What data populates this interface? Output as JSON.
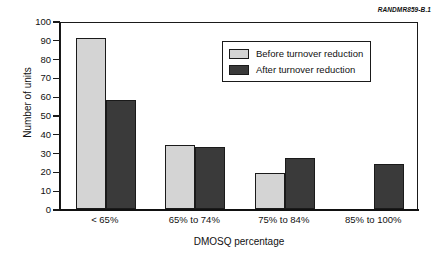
{
  "source_tag": "RANDMR859-B.1",
  "legend": {
    "position": "top-right-inside",
    "entries": [
      {
        "label": "Before turnover reduction",
        "color": "#d4d4d4",
        "swatch_name": "legend-swatch-before"
      },
      {
        "label": "After turnover reduction",
        "color": "#3a3a3a",
        "swatch_name": "legend-swatch-after"
      }
    ]
  },
  "chart_data": {
    "type": "bar",
    "title": "",
    "subtitle": "",
    "xlabel": "DMOSQ percentage",
    "ylabel": "Number of units",
    "categories": [
      "< 65%",
      "65% to 74%",
      "75% to 84%",
      "85% to 100%"
    ],
    "series": [
      {
        "name": "Before turnover reduction",
        "color": "#d4d4d4",
        "values": [
          91,
          34,
          19,
          0
        ]
      },
      {
        "name": "After turnover reduction",
        "color": "#3a3a3a",
        "values": [
          58,
          33,
          27,
          24
        ]
      }
    ],
    "ylim": [
      0,
      100
    ],
    "yticks": [
      0,
      10,
      20,
      30,
      40,
      50,
      60,
      70,
      80,
      90,
      100
    ],
    "ytick_labels": [
      "0",
      "10",
      "20",
      "30",
      "40",
      "50",
      "60",
      "70",
      "80",
      "90",
      "100"
    ],
    "grid": false,
    "legend_position": "upper right"
  }
}
